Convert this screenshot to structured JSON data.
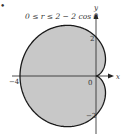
{
  "title": "0 ≤ r ≤ 2 − 2 cos θ",
  "bullet": "•",
  "axes": {
    "x_label": "x",
    "y_label": "y",
    "origin_label": "0",
    "ticks": [
      {
        "label": "−4",
        "axis": "x",
        "value": -4
      },
      {
        "label": "2",
        "axis": "y",
        "value": 2
      },
      {
        "label": "−2",
        "axis": "y",
        "value": -2
      }
    ]
  },
  "region": {
    "curve": "r = 2 − 2 cos θ",
    "fill_color": "#c8c8c8",
    "stroke_color": "#1a1a1a"
  }
}
